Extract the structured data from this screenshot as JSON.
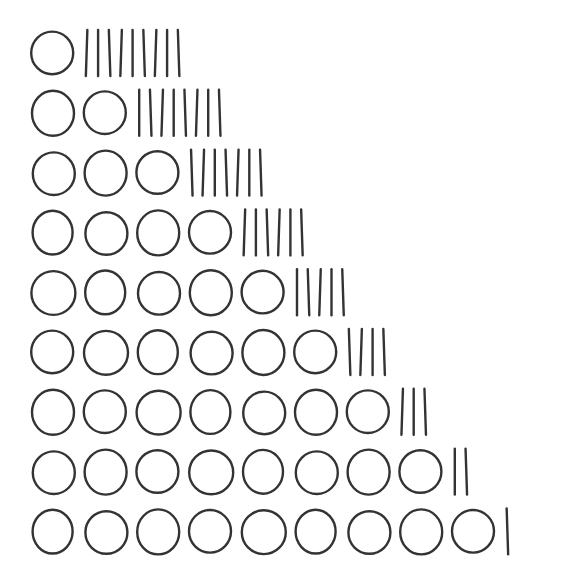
{
  "diagram": {
    "stroke_color": "#333333",
    "background": "#ffffff",
    "rows": [
      {
        "circles": 1,
        "lines": 9
      },
      {
        "circles": 2,
        "lines": 8
      },
      {
        "circles": 3,
        "lines": 7
      },
      {
        "circles": 4,
        "lines": 6
      },
      {
        "circles": 5,
        "lines": 5
      },
      {
        "circles": 6,
        "lines": 4
      },
      {
        "circles": 7,
        "lines": 3
      },
      {
        "circles": 8,
        "lines": 2
      },
      {
        "circles": 9,
        "lines": 1
      }
    ]
  }
}
